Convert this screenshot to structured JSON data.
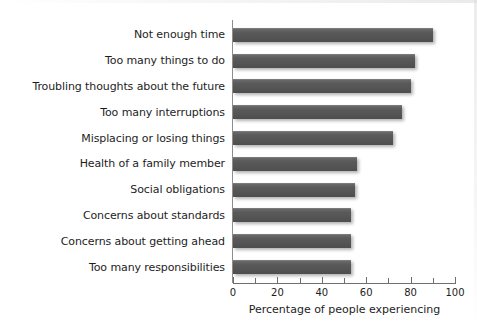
{
  "chart_data": {
    "type": "bar",
    "orientation": "horizontal",
    "title": "",
    "xlabel": "Percentage of people experiencing",
    "ylabel": "",
    "xlim": [
      0,
      100
    ],
    "xticks": [
      0,
      20,
      40,
      60,
      80,
      100
    ],
    "xtick_labels": [
      "0",
      "20",
      "40",
      "60",
      "80",
      "100"
    ],
    "minor_xticks": [
      10,
      30,
      50,
      70,
      90
    ],
    "grid": false,
    "legend": null,
    "bar_color": "#595959",
    "categories": [
      "Not enough time",
      "Too many things to do",
      "Troubling thoughts about the future",
      "Too many interruptions",
      "Misplacing or losing things",
      "Health of a family member",
      "Social obligations",
      "Concerns about standards",
      "Concerns about getting ahead",
      "Too many responsibilities"
    ],
    "values": [
      90,
      82,
      80,
      76,
      72,
      56,
      55,
      53,
      53,
      53
    ]
  },
  "axis": {
    "x_title": "Percentage of people experiencing"
  }
}
